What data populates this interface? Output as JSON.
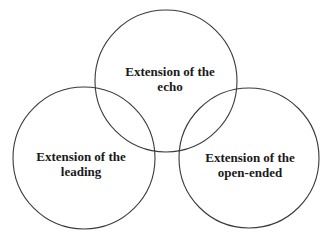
{
  "diagram": {
    "type": "venn-3",
    "stroke_color": "#3a3a3a",
    "text_color": "#1a1a1a",
    "background": "#ffffff",
    "circles": [
      {
        "id": "echo",
        "cx": 166,
        "cy": 81,
        "r": 71,
        "label_lines": [
          "Extension of the",
          "echo"
        ],
        "label_x": 170,
        "label_y1": 76,
        "label_y2": 91
      },
      {
        "id": "leading",
        "cx": 84,
        "cy": 158,
        "r": 71,
        "label_lines": [
          "Extension of the",
          "leading"
        ],
        "label_x": 81,
        "label_y1": 161,
        "label_y2": 176
      },
      {
        "id": "open-ended",
        "cx": 249,
        "cy": 158,
        "r": 70,
        "label_lines": [
          "Extension of the",
          "open-ended"
        ],
        "label_x": 250,
        "label_y1": 162,
        "label_y2": 177
      }
    ]
  }
}
